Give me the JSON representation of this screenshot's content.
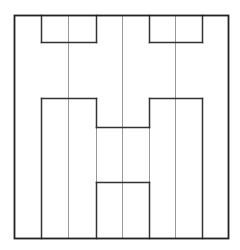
{
  "diagram": {
    "type": "symmetric-line-partition",
    "canvas": {
      "width": 240,
      "height": 250,
      "background": "#ffffff"
    },
    "colors": {
      "frame": "#222222",
      "dark_line": "#333333",
      "light_line": "#999999"
    },
    "frame": {
      "x1": 14,
      "y1": 15,
      "x2": 228,
      "y2": 238
    },
    "dark_segments": [
      [
        41,
        15,
        41,
        42
      ],
      [
        41,
        42,
        96,
        42
      ],
      [
        96,
        42,
        96,
        15
      ],
      [
        149,
        15,
        149,
        42
      ],
      [
        149,
        42,
        202,
        42
      ],
      [
        202,
        42,
        202,
        15
      ],
      [
        41,
        238,
        41,
        98
      ],
      [
        41,
        98,
        96,
        98
      ],
      [
        96,
        98,
        96,
        127
      ],
      [
        96,
        127,
        149,
        127
      ],
      [
        149,
        127,
        149,
        98
      ],
      [
        149,
        98,
        202,
        98
      ],
      [
        202,
        98,
        202,
        238
      ],
      [
        96,
        238,
        96,
        182
      ],
      [
        96,
        182,
        149,
        182
      ],
      [
        149,
        182,
        149,
        238
      ]
    ],
    "light_segments": [
      [
        68,
        15,
        68,
        238
      ],
      [
        122,
        15,
        122,
        238
      ],
      [
        175,
        15,
        175,
        238
      ],
      [
        96,
        127,
        96,
        182
      ],
      [
        149,
        127,
        149,
        182
      ]
    ]
  }
}
